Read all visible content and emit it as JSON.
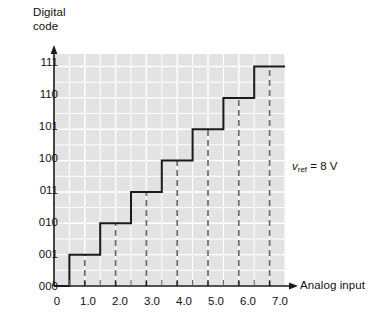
{
  "chart_data": {
    "type": "line",
    "title": "",
    "subtitle": "",
    "xlabel": "Analog input",
    "ylabel": "Digital code",
    "grid": true,
    "legend": "none",
    "annotations": [
      {
        "name": "vref-annotation",
        "text_variable": "v",
        "text_subscript": "ref",
        "text_rest": " = 8 V",
        "full_text": "vref = 8 V",
        "x_px": 292,
        "y_px": 160
      }
    ],
    "x": {
      "label": "Analog input",
      "ticks": [
        0,
        1.0,
        2.0,
        3.0,
        4.0,
        5.0,
        6.0,
        7.0
      ],
      "tick_labels": [
        "0",
        "1.0",
        "2.0",
        "3.0",
        "4.0",
        "5.0",
        "6.0",
        "7.0"
      ],
      "xlim": [
        0,
        7.5
      ],
      "minor_grid_step": 0.5
    },
    "y": {
      "label": "Digital code",
      "ticks": [
        0,
        1,
        2,
        3,
        4,
        5,
        6,
        7
      ],
      "tick_labels": [
        "000",
        "001",
        "010",
        "011",
        "100",
        "101",
        "110",
        "111"
      ],
      "ylim": [
        0,
        7.4
      ],
      "minor_grid_step": 0.5
    },
    "series": [
      {
        "name": "ADC transfer staircase",
        "type": "step",
        "color": "#1a1a1a",
        "steps": [
          {
            "code": "000",
            "level": 0,
            "x_start": 0.0,
            "x_end": 0.5
          },
          {
            "code": "001",
            "level": 1,
            "x_start": 0.5,
            "x_end": 1.5
          },
          {
            "code": "010",
            "level": 2,
            "x_start": 1.5,
            "x_end": 2.5
          },
          {
            "code": "011",
            "level": 3,
            "x_start": 2.5,
            "x_end": 3.5
          },
          {
            "code": "100",
            "level": 4,
            "x_start": 3.5,
            "x_end": 4.5
          },
          {
            "code": "101",
            "level": 5,
            "x_start": 4.5,
            "x_end": 5.5
          },
          {
            "code": "110",
            "level": 6,
            "x_start": 5.5,
            "x_end": 6.5
          },
          {
            "code": "111",
            "level": 7,
            "x_start": 6.5,
            "x_end": 7.5
          }
        ]
      }
    ],
    "dashed_markers": {
      "name": "code-center-dashed-lines",
      "color": "#6b6b6b",
      "style": "dashed",
      "x_values": [
        1.0,
        2.0,
        3.0,
        4.0,
        5.0,
        6.0,
        7.0
      ]
    },
    "colors": {
      "plot_background": "#e3e3e3",
      "gridline": "#ffffff",
      "axis": "#1a1a1a",
      "curve": "#1a1a1a",
      "dashed": "#6b6b6b",
      "page_background": "#ffffff",
      "text": "#111111"
    }
  },
  "axes": {
    "y_title": "Digital\ncode",
    "x_title": "Analog input"
  },
  "y_tick_labels": [
    {
      "label": "111",
      "y_px": 62
    },
    {
      "label": "110",
      "y_px": 94
    },
    {
      "label": "101",
      "y_px": 126
    },
    {
      "label": "100",
      "y_px": 158
    },
    {
      "label": "011",
      "y_px": 190
    },
    {
      "label": "010",
      "y_px": 222
    },
    {
      "label": "001",
      "y_px": 254
    },
    {
      "label": "000",
      "y_px": 286
    }
  ],
  "x_tick_labels": [
    {
      "label": "0",
      "x_px": 57
    },
    {
      "label": "1.0",
      "x_px": 88
    },
    {
      "label": "2.0",
      "x_px": 120
    },
    {
      "label": "3.0",
      "x_px": 152
    },
    {
      "label": "4.0",
      "x_px": 184
    },
    {
      "label": "5.0",
      "x_px": 216
    },
    {
      "label": "6.0",
      "x_px": 248
    },
    {
      "label": "7.0",
      "x_px": 280
    }
  ],
  "annotation": {
    "variable": "v",
    "subscript": "ref",
    "rest": " = 8 V"
  }
}
